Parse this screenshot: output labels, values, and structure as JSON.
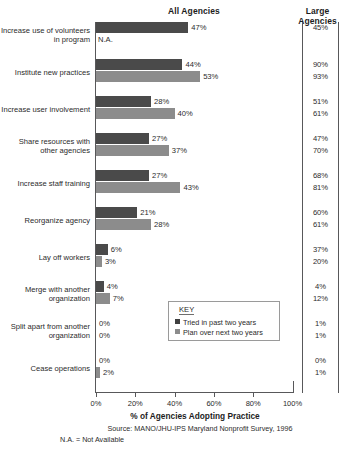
{
  "headers": {
    "all_agencies": "All Agencies",
    "large_agencies": "Large Agencies"
  },
  "legend": {
    "title": "KEY",
    "items": [
      {
        "label": "Tried in past two years",
        "color": "#3f3f3f"
      },
      {
        "label": "Plan over next two years",
        "color": "#8c8c8c"
      }
    ]
  },
  "footer": {
    "xlabel": "% of Agencies Adopting Practice",
    "source": "Source: MANO/JHU-IPS Maryland Nonprofit Survey, 1996",
    "na_note": "N.A. = Not Available"
  },
  "axis": {
    "ticks": [
      "0%",
      "20%",
      "40%",
      "60%",
      "80%",
      "100%"
    ],
    "min": 0,
    "max": 100
  },
  "na_text": "N.A.",
  "rows": [
    {
      "category": "Increase use of volunteers in program",
      "tried": 47,
      "tried_label": "47%",
      "plan": null,
      "plan_label": "N.A.",
      "large_tried": "45%",
      "large_plan": ""
    },
    {
      "category": "Institute new practices",
      "tried": 44,
      "tried_label": "44%",
      "plan": 53,
      "plan_label": "53%",
      "large_tried": "90%",
      "large_plan": "93%"
    },
    {
      "category": "Increase user involvement",
      "tried": 28,
      "tried_label": "28%",
      "plan": 40,
      "plan_label": "40%",
      "large_tried": "51%",
      "large_plan": "61%"
    },
    {
      "category": "Share resources with other agencies",
      "tried": 27,
      "tried_label": "27%",
      "plan": 37,
      "plan_label": "37%",
      "large_tried": "47%",
      "large_plan": "70%"
    },
    {
      "category": "Increase staff training",
      "tried": 27,
      "tried_label": "27%",
      "plan": 43,
      "plan_label": "43%",
      "large_tried": "68%",
      "large_plan": "81%"
    },
    {
      "category": "Reorganize agency",
      "tried": 21,
      "tried_label": "21%",
      "plan": 28,
      "plan_label": "28%",
      "large_tried": "60%",
      "large_plan": "61%"
    },
    {
      "category": "Lay off workers",
      "tried": 6,
      "tried_label": "6%",
      "plan": 3,
      "plan_label": "3%",
      "large_tried": "37%",
      "large_plan": "20%"
    },
    {
      "category": "Merge with another organization",
      "tried": 4,
      "tried_label": "4%",
      "plan": 7,
      "plan_label": "7%",
      "large_tried": "4%",
      "large_plan": "12%"
    },
    {
      "category": "Split apart from another organization",
      "tried": 0,
      "tried_label": "0%",
      "plan": 0,
      "plan_label": "0%",
      "large_tried": "1%",
      "large_plan": "1%"
    },
    {
      "category": "Cease operations",
      "tried": 0,
      "tried_label": "0%",
      "plan": 2,
      "plan_label": "2%",
      "large_tried": "0%",
      "large_plan": "1%"
    }
  ],
  "chart_data": {
    "type": "bar",
    "title": "",
    "xlabel": "% of Agencies Adopting Practice",
    "ylabel": "",
    "xlim": [
      0,
      100
    ],
    "grid": false,
    "orientation": "horizontal",
    "legend_position": "inside-center-right",
    "categories": [
      "Increase use of volunteers in program",
      "Institute new practices",
      "Increase user involvement",
      "Share resources with other agencies",
      "Increase staff training",
      "Reorganize agency",
      "Lay off workers",
      "Merge with another organization",
      "Split apart from another organization",
      "Cease operations"
    ],
    "series": [
      {
        "name": "Tried in past two years",
        "color": "#4a4a4a",
        "values": [
          47,
          44,
          28,
          27,
          27,
          21,
          6,
          4,
          0,
          0
        ]
      },
      {
        "name": "Plan over next two years",
        "color": "#8c8c8c",
        "values": [
          null,
          53,
          40,
          37,
          43,
          28,
          3,
          7,
          0,
          2
        ]
      }
    ],
    "secondary_column": {
      "name": "Large Agencies",
      "series": [
        {
          "name": "Tried in past two years",
          "values": [
            "45%",
            "90%",
            "51%",
            "47%",
            "68%",
            "60%",
            "37%",
            "4%",
            "1%",
            "0%"
          ]
        },
        {
          "name": "Plan over next two years",
          "values": [
            "",
            "93%",
            "61%",
            "70%",
            "81%",
            "61%",
            "20%",
            "12%",
            "1%",
            "1%"
          ]
        }
      ]
    },
    "annotations": [
      "N.A. = Not Available"
    ],
    "source": "Source: MANO/JHU-IPS Maryland Nonprofit Survey, 1996"
  }
}
